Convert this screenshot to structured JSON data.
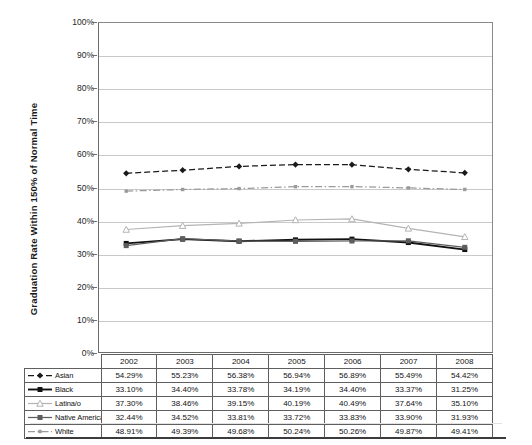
{
  "chart_data": {
    "type": "line",
    "title": "",
    "xlabel": "",
    "ylabel": "Graduation Rate Within 150% of Normal Time",
    "ylim": [
      0,
      100
    ],
    "ytick_labels": [
      "100%",
      "90%",
      "80%",
      "70%",
      "60%",
      "50%",
      "40%",
      "30%",
      "20%",
      "10%",
      "0%"
    ],
    "ytick_values": [
      100,
      90,
      80,
      70,
      60,
      50,
      40,
      30,
      20,
      10,
      0
    ],
    "grid": true,
    "legend_position": "table-left-column",
    "categories": [
      "2002",
      "2003",
      "2004",
      "2005",
      "2006",
      "2007",
      "2008"
    ],
    "series": [
      {
        "name": "Asian",
        "marker": "filled-diamond",
        "line_style": "dashed",
        "color": "#1a1a1a",
        "values": [
          54.29,
          55.23,
          56.38,
          56.94,
          56.89,
          55.49,
          54.42
        ],
        "labels": [
          "54.29%",
          "55.23%",
          "56.38%",
          "56.94%",
          "56.89%",
          "55.49%",
          "54.42%"
        ]
      },
      {
        "name": "Black",
        "marker": "filled-square",
        "line_style": "solid",
        "color": "#111111",
        "values": [
          33.1,
          34.4,
          33.78,
          34.19,
          34.4,
          33.37,
          31.25
        ],
        "labels": [
          "33.10%",
          "34.40%",
          "33.78%",
          "34.19%",
          "34.40%",
          "33.37%",
          "31.25%"
        ]
      },
      {
        "name": "Latina/o",
        "marker": "open-triangle",
        "line_style": "solid",
        "color": "#b4b4b4",
        "values": [
          37.3,
          38.46,
          39.15,
          40.19,
          40.49,
          37.64,
          35.1
        ],
        "labels": [
          "37.30%",
          "38.46%",
          "39.15%",
          "40.19%",
          "40.49%",
          "37.64%",
          "35.10%"
        ]
      },
      {
        "name": "Native American",
        "marker": "filled-square",
        "line_style": "solid",
        "color": "#5d5d5d",
        "values": [
          32.44,
          34.52,
          33.81,
          33.72,
          33.83,
          33.9,
          31.93
        ],
        "labels": [
          "32.44%",
          "34.52%",
          "33.81%",
          "33.72%",
          "33.83%",
          "33.90%",
          "31.93%"
        ]
      },
      {
        "name": "White",
        "marker": "small-square",
        "line_style": "dash-dot",
        "color": "#9a9a9a",
        "values": [
          48.91,
          49.39,
          49.68,
          50.24,
          50.26,
          49.87,
          49.41
        ],
        "labels": [
          "48.91%",
          "49.39%",
          "49.68%",
          "50.24%",
          "50.26%",
          "49.87%",
          "49.41%"
        ]
      }
    ]
  },
  "table": {
    "corner_label": "",
    "column_headers": [
      "2002",
      "2003",
      "2004",
      "2005",
      "2006",
      "2007",
      "2008"
    ],
    "rows": [
      {
        "legend": "Asian",
        "cells": [
          "54.29%",
          "55.23%",
          "56.38%",
          "56.94%",
          "56.89%",
          "55.49%",
          "54.42%"
        ]
      },
      {
        "legend": "Black",
        "cells": [
          "33.10%",
          "34.40%",
          "33.78%",
          "34.19%",
          "34.40%",
          "33.37%",
          "31.25%"
        ]
      },
      {
        "legend": "Latina/o",
        "cells": [
          "37.30%",
          "38.46%",
          "39.15%",
          "40.19%",
          "40.49%",
          "37.64%",
          "35.10%"
        ]
      },
      {
        "legend": "Native American",
        "cells": [
          "32.44%",
          "34.52%",
          "33.81%",
          "33.72%",
          "33.83%",
          "33.90%",
          "31.93%"
        ]
      },
      {
        "legend": "White",
        "cells": [
          "48.91%",
          "49.39%",
          "49.68%",
          "50.24%",
          "50.26%",
          "49.87%",
          "49.41%"
        ]
      }
    ]
  },
  "colors": {
    "axis": "#6b6b6b",
    "grid": "#c9c9c9",
    "text": "#121212",
    "rule": "#3b3b3b"
  }
}
